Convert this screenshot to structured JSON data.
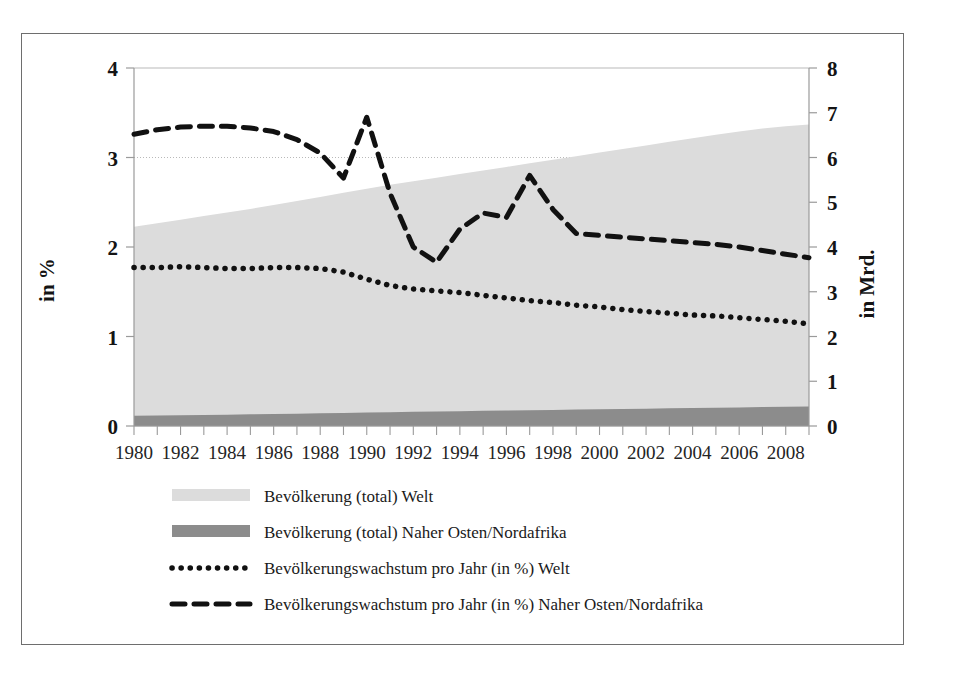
{
  "chart_data": {
    "type": "area",
    "title": "",
    "xlabel": "",
    "ylabel": "in %",
    "ylabel_right": "in Mrd.",
    "grid": true,
    "legend_position": "bottom",
    "x": [
      1980,
      1981,
      1982,
      1983,
      1984,
      1985,
      1986,
      1987,
      1988,
      1989,
      1990,
      1991,
      1992,
      1993,
      1994,
      1995,
      1996,
      1997,
      1998,
      1999,
      2000,
      2001,
      2002,
      2003,
      2004,
      2005,
      2006,
      2007,
      2008,
      2009
    ],
    "xtick_labels": [
      "1980",
      "1982",
      "1984",
      "1986",
      "1988",
      "1990",
      "1992",
      "1994",
      "1996",
      "1998",
      "2000",
      "2002",
      "2004",
      "2006",
      "2008"
    ],
    "xticks": [
      1980,
      1982,
      1984,
      1986,
      1988,
      1990,
      1992,
      1994,
      1996,
      1998,
      2000,
      2002,
      2004,
      2006,
      2008
    ],
    "ylim": [
      0,
      4
    ],
    "yticks": [
      0,
      1,
      2,
      3,
      4
    ],
    "ytick_labels": [
      "0",
      "1",
      "2",
      "3",
      "4"
    ],
    "ylim_right": [
      0,
      8
    ],
    "yticks_right": [
      0,
      1,
      2,
      3,
      4,
      5,
      6,
      7,
      8
    ],
    "ytick_labels_right": [
      "0",
      "1",
      "2",
      "3",
      "4",
      "5",
      "6",
      "7",
      "8"
    ],
    "series": [
      {
        "name": "Bevölkerung (total) Welt",
        "type": "area",
        "axis": "right",
        "unit": "Mrd.",
        "color": "#dcdcdc",
        "values": [
          4.45,
          4.53,
          4.61,
          4.69,
          4.77,
          4.85,
          4.94,
          5.03,
          5.12,
          5.21,
          5.3,
          5.39,
          5.47,
          5.55,
          5.63,
          5.71,
          5.79,
          5.87,
          5.95,
          6.03,
          6.11,
          6.19,
          6.27,
          6.35,
          6.43,
          6.51,
          6.58,
          6.65,
          6.7,
          6.74
        ]
      },
      {
        "name": "Bevölkerung (total) Naher Osten/Nordafrika",
        "type": "area",
        "axis": "right",
        "unit": "Mrd.",
        "color": "#8c8c8c",
        "values": [
          0.23,
          0.235,
          0.24,
          0.247,
          0.254,
          0.261,
          0.269,
          0.276,
          0.284,
          0.292,
          0.3,
          0.308,
          0.316,
          0.323,
          0.33,
          0.338,
          0.345,
          0.352,
          0.359,
          0.366,
          0.373,
          0.38,
          0.387,
          0.394,
          0.401,
          0.408,
          0.415,
          0.422,
          0.428,
          0.434
        ]
      },
      {
        "name": "Bevölkerungswachstum pro Jahr (in %) Welt",
        "type": "line",
        "style": "dotted",
        "axis": "left",
        "unit": "%",
        "color": "#111111",
        "values": [
          1.77,
          1.77,
          1.78,
          1.77,
          1.76,
          1.76,
          1.77,
          1.77,
          1.76,
          1.72,
          1.64,
          1.57,
          1.53,
          1.51,
          1.49,
          1.46,
          1.43,
          1.4,
          1.38,
          1.35,
          1.33,
          1.3,
          1.28,
          1.26,
          1.24,
          1.23,
          1.21,
          1.19,
          1.17,
          1.14
        ]
      },
      {
        "name": "Bevölkerungswachstum pro Jahr (in %) Naher Osten/Nordafrika",
        "type": "line",
        "style": "dashed",
        "axis": "left",
        "unit": "%",
        "color": "#111111",
        "values": [
          3.26,
          3.31,
          3.34,
          3.35,
          3.35,
          3.33,
          3.29,
          3.2,
          3.05,
          2.77,
          3.45,
          2.6,
          2.0,
          1.83,
          2.2,
          2.38,
          2.33,
          2.8,
          2.42,
          2.15,
          2.13,
          2.11,
          2.09,
          2.07,
          2.05,
          2.03,
          2.0,
          1.96,
          1.92,
          1.88
        ]
      }
    ],
    "legend": [
      {
        "label": "Bevölkerung (total) Welt",
        "marker": "swatch",
        "color": "#dcdcdc"
      },
      {
        "label": "Bevölkerung (total) Naher Osten/Nordafrika",
        "marker": "swatch",
        "color": "#8c8c8c"
      },
      {
        "label": "Bevölkerungswachstum pro Jahr (in %) Welt",
        "marker": "dotted-line",
        "color": "#111111"
      },
      {
        "label": "Bevölkerungswachstum pro Jahr (in %) Naher Osten/Nordafrika",
        "marker": "dashed-line",
        "color": "#111111"
      }
    ],
    "colors": {
      "area_world": "#dcdcdc",
      "area_mena": "#8c8c8c",
      "line": "#111111",
      "axis": "#9a9a9a",
      "frame": "#6e6e6e",
      "background": "#ffffff"
    }
  }
}
